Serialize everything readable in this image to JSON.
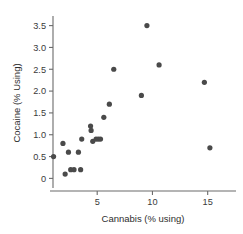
{
  "chart_data": {
    "type": "scatter",
    "title": "",
    "xlabel": "Cannabis (% using)",
    "ylabel": "Cocaine (% Using)",
    "xlim": [
      1.0,
      17.2
    ],
    "ylim": [
      -0.22,
      3.72
    ],
    "xticks": [
      5,
      10,
      15
    ],
    "xtick_labels": [
      "5",
      "10",
      "15"
    ],
    "yticks": [
      0,
      0.5,
      1.0,
      1.5,
      2.0,
      2.5,
      3.0,
      3.5
    ],
    "ytick_labels": [
      "0",
      "0.5",
      "1.0",
      "1.5",
      "2.0",
      "2.5",
      "3.0",
      "3.5"
    ],
    "grid": false,
    "legend": false,
    "point_color": "#4a4a4a",
    "point_radius": 2.6,
    "axis_color": "#6b6b6b",
    "series": [
      {
        "name": "countries",
        "points": [
          [
            1.05,
            0.5
          ],
          [
            1.9,
            0.8
          ],
          [
            2.1,
            0.1
          ],
          [
            2.4,
            0.6
          ],
          [
            2.6,
            0.2
          ],
          [
            2.9,
            0.2
          ],
          [
            3.3,
            0.6
          ],
          [
            3.5,
            0.2
          ],
          [
            3.6,
            0.9
          ],
          [
            4.4,
            1.2
          ],
          [
            4.45,
            1.1
          ],
          [
            4.6,
            0.85
          ],
          [
            4.9,
            0.9
          ],
          [
            5.1,
            0.9
          ],
          [
            5.3,
            0.9
          ],
          [
            5.6,
            1.4
          ],
          [
            6.1,
            1.7
          ],
          [
            6.5,
            2.5
          ],
          [
            9.0,
            1.9
          ],
          [
            9.5,
            3.5
          ],
          [
            10.6,
            2.6
          ],
          [
            14.7,
            2.2
          ],
          [
            15.2,
            0.7
          ]
        ]
      }
    ]
  },
  "axes": {
    "x_title": "Cannabis (% using)",
    "y_title": "Cocaine (% Using)"
  }
}
